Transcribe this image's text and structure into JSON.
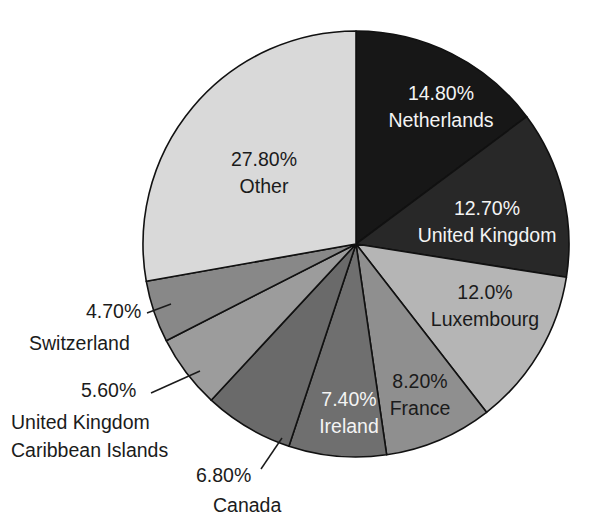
{
  "chart_data": {
    "type": "pie",
    "title": "",
    "subtitle": "",
    "xlabel": "",
    "ylabel": "",
    "legend_position": "none",
    "grid": false,
    "units": "percent",
    "start_angle_deg": 0,
    "direction": "clockwise",
    "categories": [
      "Netherlands",
      "United Kingdom",
      "Luxembourg",
      "France",
      "Ireland",
      "Canada",
      "United Kingdom Caribbean Islands",
      "Switzerland",
      "Other"
    ],
    "values": [
      14.8,
      12.7,
      12.0,
      8.2,
      7.4,
      6.8,
      5.6,
      4.7,
      27.8
    ],
    "value_labels": [
      "14.80%",
      "12.70%",
      "12.0%",
      "8.20%",
      "7.40%",
      "6.80%",
      "5.60%",
      "4.70%",
      "27.80%"
    ],
    "colors": [
      "#171717",
      "#282828",
      "#b5b5b5",
      "#8f8f8f",
      "#6f6f6f",
      "#6a6a6a",
      "#9c9c9c",
      "#888888",
      "#d9d9d9"
    ],
    "slices": [
      {
        "name": "Netherlands",
        "value": 14.8,
        "value_label": "14.80%",
        "name_lines": [
          "Netherlands"
        ],
        "color": "#171717",
        "label_placement": "inside",
        "label_color": "light"
      },
      {
        "name": "United Kingdom",
        "value": 12.7,
        "value_label": "12.70%",
        "name_lines": [
          "United Kingdom"
        ],
        "color": "#282828",
        "label_placement": "inside",
        "label_color": "light"
      },
      {
        "name": "Luxembourg",
        "value": 12.0,
        "value_label": "12.0%",
        "name_lines": [
          "Luxembourg"
        ],
        "color": "#b5b5b5",
        "label_placement": "inside",
        "label_color": "dark"
      },
      {
        "name": "France",
        "value": 8.2,
        "value_label": "8.20%",
        "name_lines": [
          "France"
        ],
        "color": "#8f8f8f",
        "label_placement": "inside",
        "label_color": "dark"
      },
      {
        "name": "Ireland",
        "value": 7.4,
        "value_label": "7.40%",
        "name_lines": [
          "Ireland"
        ],
        "color": "#6f6f6f",
        "label_placement": "inside",
        "label_color": "light"
      },
      {
        "name": "Canada",
        "value": 6.8,
        "value_label": "6.80%",
        "name_lines": [
          "Canada"
        ],
        "color": "#6a6a6a",
        "label_placement": "outside",
        "label_color": "dark"
      },
      {
        "name": "United Kingdom Caribbean Islands",
        "value": 5.6,
        "value_label": "5.60%",
        "name_lines": [
          "United Kingdom",
          "Caribbean Islands"
        ],
        "color": "#9c9c9c",
        "label_placement": "outside",
        "label_color": "dark"
      },
      {
        "name": "Switzerland",
        "value": 4.7,
        "value_label": "4.70%",
        "name_lines": [
          "Switzerland"
        ],
        "color": "#888888",
        "label_placement": "outside",
        "label_color": "dark"
      },
      {
        "name": "Other",
        "value": 27.8,
        "value_label": "27.80%",
        "name_lines": [
          "Other"
        ],
        "color": "#d9d9d9",
        "label_placement": "inside",
        "label_color": "dark"
      }
    ]
  },
  "labels": {
    "netherlands_pct": "14.80%",
    "netherlands_name": "Netherlands",
    "united_kingdom_pct": "12.70%",
    "united_kingdom_name": "United Kingdom",
    "luxembourg_pct": "12.0%",
    "luxembourg_name": "Luxembourg",
    "france_pct": "8.20%",
    "france_name": "France",
    "ireland_pct": "7.40%",
    "ireland_name": "Ireland",
    "canada_pct": "6.80%",
    "canada_name": "Canada",
    "uk_caribbean_pct": "5.60%",
    "uk_caribbean_name_line1": "United Kingdom",
    "uk_caribbean_name_line2": "Caribbean Islands",
    "switzerland_pct": "4.70%",
    "switzerland_name": "Switzerland",
    "other_pct": "27.80%",
    "other_name": "Other"
  }
}
